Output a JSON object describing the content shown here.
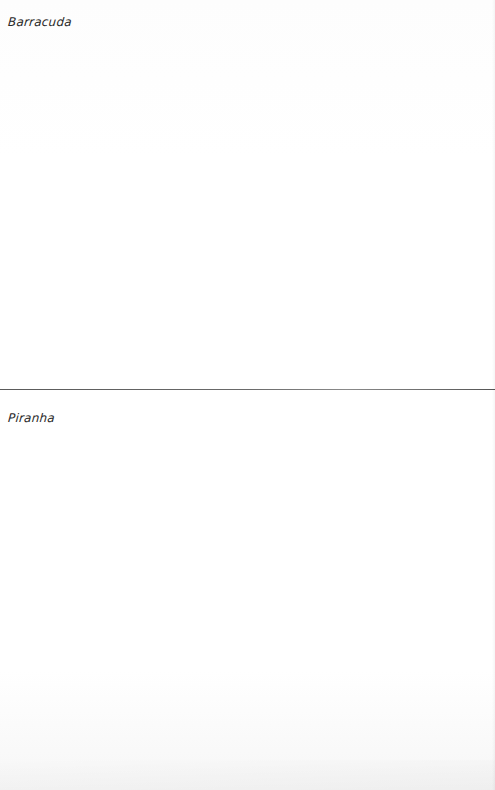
{
  "sections": [
    {
      "label": "Barracuda"
    },
    {
      "label": "Piranha"
    }
  ],
  "colors": {
    "background": "#ffffff",
    "text": "#2a2a2a",
    "divider": "#666666"
  }
}
